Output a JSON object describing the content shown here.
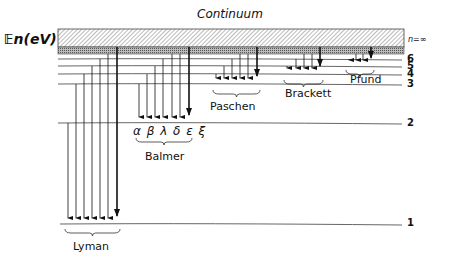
{
  "title": "Continuum",
  "axis_label": "𝔼n(eV)",
  "continuum_label": "n=∞",
  "levels": [
    {
      "n": "1",
      "y": 224
    },
    {
      "n": "2",
      "y": 123
    },
    {
      "n": "3",
      "y": 84
    },
    {
      "n": "4",
      "y": 74
    },
    {
      "n": "5",
      "y": 66
    },
    {
      "n": "6",
      "y": 59
    }
  ],
  "series": [
    {
      "name": "Lyman",
      "final_level": 1,
      "arrow_xs": [
        68,
        76,
        84,
        92,
        100,
        108,
        117
      ],
      "end_y": 222
    },
    {
      "name": "Balmer",
      "final_level": 2,
      "arrow_xs": [
        139,
        147,
        155,
        163,
        172,
        180,
        189
      ],
      "end_y": 121,
      "lines": "α β λ δ ε ξ"
    },
    {
      "name": "Paschen",
      "final_level": 3,
      "arrow_xs": [
        216,
        224,
        232,
        240,
        248,
        257
      ],
      "end_y": 82
    },
    {
      "name": "Brackett",
      "final_level": 4,
      "arrow_xs": [
        287,
        296,
        304,
        312,
        320
      ],
      "end_y": 72
    },
    {
      "name": "Pfund",
      "final_level": 5,
      "arrow_xs": [
        349,
        356,
        363,
        371
      ],
      "end_y": 64
    }
  ],
  "colors": {
    "ink": "#111111",
    "line": "#555555",
    "hatch": "#666666"
  }
}
